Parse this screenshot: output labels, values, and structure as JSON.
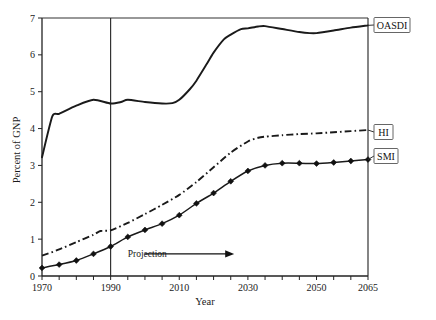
{
  "chart_data": {
    "type": "line",
    "title": "",
    "subtitle": "",
    "xlabel": "Year",
    "ylabel": "Percent of GNP",
    "xlim": [
      1970,
      2065
    ],
    "ylim": [
      0,
      7
    ],
    "grid": false,
    "legend_position": "right-outside-boxes",
    "x_ticks_major": [
      1970,
      1990,
      2010,
      2030,
      2050,
      2065
    ],
    "x_tick_labels": [
      "1970",
      "1990",
      "2010",
      "2030",
      "2050",
      "2065"
    ],
    "x_ticks_minor_step": 5,
    "y_ticks": [
      0,
      1,
      2,
      3,
      4,
      5,
      6,
      7
    ],
    "y_tick_labels": [
      "0",
      "1",
      "2",
      "3",
      "4",
      "5",
      "6",
      "7"
    ],
    "annotations": [
      {
        "name": "projection-annotation",
        "text": "Projection",
        "x": 1995,
        "y": 0.6,
        "arrow_from_x": 2000,
        "arrow_to_x": 2026,
        "arrow_y": 0.6
      },
      {
        "name": "projection-divider",
        "text": "",
        "x": 1990,
        "y_from": 0,
        "y_to": 7
      }
    ],
    "series": [
      {
        "name": "OASDI",
        "label": "OASDI",
        "style": "solid",
        "markers": false,
        "x": [
          1970,
          1973,
          1975,
          1980,
          1985,
          1990,
          1993,
          1995,
          2000,
          2005,
          2008,
          2010,
          2013,
          2015,
          2018,
          2020,
          2023,
          2025,
          2028,
          2030,
          2033,
          2035,
          2040,
          2045,
          2048,
          2050,
          2055,
          2060,
          2065
        ],
        "values": [
          3.22,
          4.33,
          4.4,
          4.62,
          4.78,
          4.68,
          4.72,
          4.78,
          4.72,
          4.68,
          4.69,
          4.78,
          5.06,
          5.3,
          5.75,
          6.06,
          6.42,
          6.55,
          6.7,
          6.72,
          6.77,
          6.78,
          6.7,
          6.62,
          6.59,
          6.59,
          6.66,
          6.74,
          6.8
        ]
      },
      {
        "name": "HI",
        "label": "HI",
        "style": "dash-dot",
        "markers": false,
        "x": [
          1970,
          1975,
          1980,
          1985,
          1987,
          1990,
          1995,
          2000,
          2005,
          2010,
          2015,
          2020,
          2025,
          2030,
          2033,
          2035,
          2040,
          2045,
          2050,
          2055,
          2060,
          2065
        ],
        "values": [
          0.55,
          0.72,
          0.92,
          1.12,
          1.22,
          1.24,
          1.44,
          1.68,
          1.93,
          2.2,
          2.55,
          2.95,
          3.35,
          3.65,
          3.75,
          3.78,
          3.82,
          3.85,
          3.87,
          3.9,
          3.93,
          3.96
        ]
      },
      {
        "name": "SMI",
        "label": "SMI",
        "style": "solid-markers",
        "markers": true,
        "x": [
          1970,
          1975,
          1980,
          1985,
          1990,
          1995,
          2000,
          2005,
          2010,
          2015,
          2020,
          2025,
          2030,
          2035,
          2040,
          2045,
          2050,
          2055,
          2060,
          2065
        ],
        "values": [
          0.22,
          0.31,
          0.42,
          0.6,
          0.8,
          1.06,
          1.25,
          1.42,
          1.65,
          1.97,
          2.25,
          2.57,
          2.85,
          3.0,
          3.06,
          3.06,
          3.05,
          3.08,
          3.12,
          3.16
        ]
      }
    ]
  },
  "legend": {
    "items": [
      {
        "label": "OASDI",
        "name": "legend-oasdi"
      },
      {
        "label": "HI",
        "name": "legend-hi"
      },
      {
        "label": "SMI",
        "name": "legend-smi"
      }
    ]
  },
  "axes": {
    "x_title": "Year",
    "y_title": "Percent of GNP"
  }
}
